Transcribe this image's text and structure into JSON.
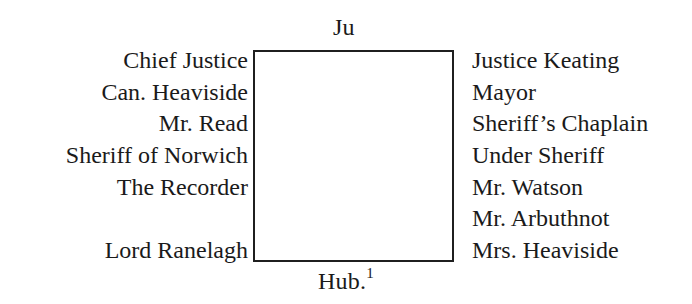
{
  "seating_plan": {
    "top_label": "Ju",
    "bottom_label": "Hub.",
    "bottom_footnote": "1",
    "left_side": [
      "Chief Justice",
      "Can. Heaviside",
      "Mr. Read",
      "Sheriff of Norwich",
      "The Recorder",
      "",
      "Lord Ranelagh"
    ],
    "right_side": [
      "Justice Keating",
      "Mayor",
      "Sheriff’s Chaplain",
      "Under Sheriff",
      "Mr. Watson",
      "Mr. Arbuthnot",
      "Mrs. Heaviside"
    ]
  }
}
